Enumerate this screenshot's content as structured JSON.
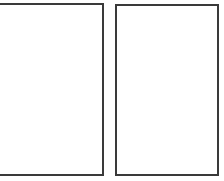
{
  "panels": [
    {
      "id": "left",
      "label": "",
      "content": ""
    },
    {
      "id": "right",
      "label": "",
      "content": ""
    }
  ],
  "colors": {
    "border": "#3a3a3a",
    "background": "#ffffff"
  }
}
